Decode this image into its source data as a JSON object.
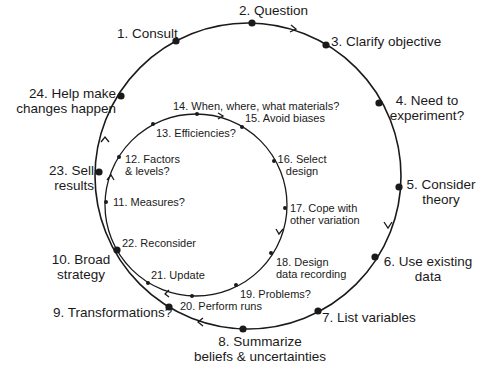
{
  "diagram": {
    "outer_cycle": {
      "steps": [
        {
          "id": 1,
          "label": "1. Consult"
        },
        {
          "id": 2,
          "label": "2. Question"
        },
        {
          "id": 3,
          "label": "3. Clarify objective"
        },
        {
          "id": 4,
          "line1": "4. Need to",
          "line2": "experiment?"
        },
        {
          "id": 5,
          "line1": "5. Consider",
          "line2": "theory"
        },
        {
          "id": 6,
          "line1": "6. Use existing",
          "line2": "data"
        },
        {
          "id": 7,
          "label": "7. List variables"
        },
        {
          "id": 8,
          "line1": "8. Summarize",
          "line2": "beliefs & uncertainties"
        },
        {
          "id": 9,
          "label": "9. Transformations?"
        },
        {
          "id": 10,
          "line1": "10. Broad",
          "line2": "strategy"
        },
        {
          "id": 23,
          "line1": "23. Sell",
          "line2": "results"
        },
        {
          "id": 24,
          "line1": "24. Help make",
          "line2": "changes happen"
        }
      ]
    },
    "inner_cycle": {
      "steps": [
        {
          "id": 11,
          "label": "11. Measures?"
        },
        {
          "id": 12,
          "line1": "12. Factors",
          "line2": "& levels?"
        },
        {
          "id": 13,
          "label": "13. Efficiencies?"
        },
        {
          "id": 14,
          "label": "14. When, where, what materials?"
        },
        {
          "id": 15,
          "label": "15. Avoid biases"
        },
        {
          "id": 16,
          "line1": "16. Select",
          "line2": "design"
        },
        {
          "id": 17,
          "line1": "17. Cope with",
          "line2": "other variation"
        },
        {
          "id": 18,
          "line1": "18. Design",
          "line2": "data recording"
        },
        {
          "id": 19,
          "label": "19. Problems?"
        },
        {
          "id": 20,
          "label": "20. Perform runs"
        },
        {
          "id": 21,
          "label": "21. Update"
        },
        {
          "id": 22,
          "label": "22. Reconsider"
        }
      ]
    },
    "colors": {
      "line": "#1a1a1a",
      "background": "#ffffff"
    }
  }
}
